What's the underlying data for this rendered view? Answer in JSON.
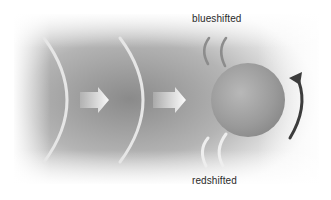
{
  "diagram": {
    "type": "doppler-shift-rotating-star",
    "labels": {
      "top": "blueshifted",
      "bottom": "redshifted"
    },
    "elements": [
      {
        "name": "incoming-wavefront-1",
        "kind": "arc"
      },
      {
        "name": "incoming-wavefront-2",
        "kind": "arc"
      },
      {
        "name": "direction-arrow-1",
        "kind": "block-arrow",
        "direction": "right"
      },
      {
        "name": "direction-arrow-2",
        "kind": "block-arrow",
        "direction": "right"
      },
      {
        "name": "star-sphere",
        "kind": "sphere"
      },
      {
        "name": "rotation-arrow",
        "kind": "curved-arrow",
        "direction": "counterclockwise"
      },
      {
        "name": "blueshifted-wavefronts",
        "kind": "compressed-arcs",
        "count": 2
      },
      {
        "name": "redshifted-wavefronts",
        "kind": "stretched-arcs",
        "count": 2
      }
    ],
    "colors": {
      "background_dark": "#8a8a8a",
      "background_light": "#f2f2f2",
      "wavefront": "#e6e6e6",
      "blue_arcs": "#8c8c8c",
      "red_arcs": "#eeeeee",
      "sphere": "#9a9a9a",
      "rotation_arrow": "#3c3c3c",
      "text": "#2a2a2a"
    }
  }
}
